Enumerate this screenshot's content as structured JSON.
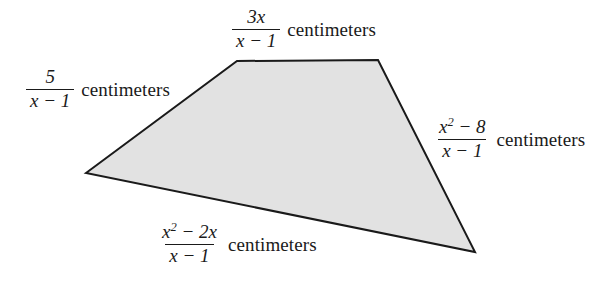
{
  "figure": {
    "name": "quadrilateral-with-rational-side-lengths",
    "background_color": "#ffffff",
    "fill_color": "#e2e2e2",
    "stroke_color": "#1a1a1a",
    "unit_word": "centimeters",
    "vertices": [
      {
        "name": "left",
        "x": 86,
        "y": 173
      },
      {
        "name": "top-left",
        "x": 237,
        "y": 61
      },
      {
        "name": "top-right",
        "x": 378,
        "y": 60
      },
      {
        "name": "bottom-right",
        "x": 475,
        "y": 252
      }
    ],
    "polygon_points": "86,173 237,61 378,60 475,252"
  },
  "labels": {
    "top": {
      "numerator": "3x",
      "denominator": "x − 1",
      "unit": "centimeters"
    },
    "left": {
      "numerator": "5",
      "denominator": "x − 1",
      "unit": "centimeters"
    },
    "right": {
      "numerator_base": "x",
      "numerator_exponent": "2",
      "numerator_tail": " − 8",
      "denominator": "x − 1",
      "unit": "centimeters"
    },
    "bottom": {
      "numerator_base": "x",
      "numerator_exponent": "2",
      "numerator_tail": " − 2x",
      "denominator": "x − 1",
      "unit": "centimeters"
    }
  }
}
